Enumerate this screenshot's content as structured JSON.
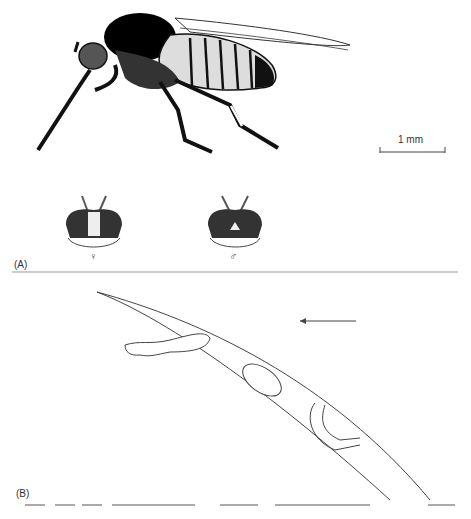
{
  "figure": {
    "panel_a": {
      "label": "(A)",
      "scale_bar": {
        "text": "1 mm"
      },
      "heads": [
        {
          "sex_symbol": "♀",
          "description": "female head, frontal view"
        },
        {
          "sex_symbol": "♂",
          "description": "male head, frontal view"
        }
      ],
      "main_subject": "adult insect, lateral view"
    },
    "panel_b": {
      "label": "(B)",
      "arrow_direction": "left",
      "subject": "larvae on a curved stalk/hair"
    }
  }
}
